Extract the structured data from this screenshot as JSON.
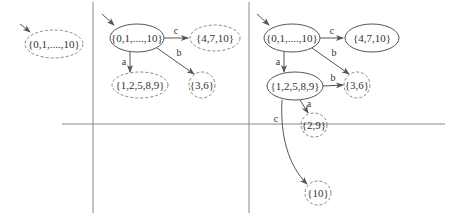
{
  "colors": {
    "line": "#888888",
    "solid_node": "#555555",
    "dashed_node": "#888888",
    "edge": "#555555",
    "text": "#333333",
    "background": "#ffffff"
  },
  "panels": [
    {
      "id": "panel-1",
      "nodes": [
        {
          "id": "p1-root",
          "label": "{0,1,....,10}",
          "style": "dashed",
          "initial": true
        }
      ],
      "edges": []
    },
    {
      "id": "panel-2",
      "nodes": [
        {
          "id": "p2-root",
          "label": "{0,1,....,10}",
          "style": "solid",
          "initial": true
        },
        {
          "id": "p2-4710",
          "label": "{4,7,10}",
          "style": "dashed"
        },
        {
          "id": "p2-12589",
          "label": "{1,2,5,8,9}",
          "style": "dashed"
        },
        {
          "id": "p2-36",
          "label": "{3,6}",
          "style": "dashed"
        }
      ],
      "edges": [
        {
          "from": "p2-root",
          "to": "p2-4710",
          "label": "c"
        },
        {
          "from": "p2-root",
          "to": "p2-12589",
          "label": "a"
        },
        {
          "from": "p2-root",
          "to": "p2-36",
          "label": "b"
        }
      ]
    },
    {
      "id": "panel-3",
      "nodes": [
        {
          "id": "p3-root",
          "label": "{0,1,....,10}",
          "style": "solid",
          "initial": true
        },
        {
          "id": "p3-4710",
          "label": "{4,7,10}",
          "style": "solid"
        },
        {
          "id": "p3-12589",
          "label": "{1,2,5,8,9}",
          "style": "solid"
        },
        {
          "id": "p3-36",
          "label": "{3,6}",
          "style": "dashed"
        },
        {
          "id": "p3-29",
          "label": "{2,9}",
          "style": "dashed"
        },
        {
          "id": "p3-10",
          "label": "{10}",
          "style": "dashed"
        }
      ],
      "edges": [
        {
          "from": "p3-root",
          "to": "p3-4710",
          "label": "c"
        },
        {
          "from": "p3-root",
          "to": "p3-12589",
          "label": "a"
        },
        {
          "from": "p3-root",
          "to": "p3-36",
          "label": "b"
        },
        {
          "from": "p3-12589",
          "to": "p3-36",
          "label": "b"
        },
        {
          "from": "p3-12589",
          "to": "p3-29",
          "label": "a"
        },
        {
          "from": "p3-12589",
          "to": "p3-10",
          "label": "c"
        }
      ]
    }
  ],
  "labels": {
    "p1_root": "{0,1,....,10}",
    "p2_root": "{0,1,....,10}",
    "p2_4710": "{4,7,10}",
    "p2_12589": "{1,2,5,8,9}",
    "p2_36": "{3,6}",
    "p3_root": "{0,1,....,10}",
    "p3_4710": "{4,7,10}",
    "p3_12589": "{1,2,5,8,9}",
    "p3_36": "{3,6}",
    "p3_29": "{2,9}",
    "p3_10": "{10}",
    "edge_a": "a",
    "edge_b": "b",
    "edge_c": "c"
  }
}
